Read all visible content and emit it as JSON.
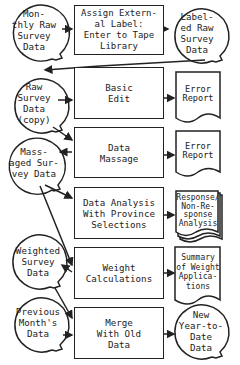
{
  "nodes": {
    "monthly_raw": {
      "label": "Mon-\nthly Raw\nSurvey\nData",
      "shape": "data-circle"
    },
    "assign_label": {
      "label": "Assign Extern-\nal Label:\nEnter to Tape\nLibrary",
      "shape": "process"
    },
    "labeled_raw": {
      "label": "Label-\ned Raw\nSurvey\nData",
      "shape": "data-circle"
    },
    "raw_copy": {
      "label": "Raw\nSurvey\nData\n(copy)",
      "shape": "data-circle"
    },
    "basic_edit": {
      "label": "Basic\nEdit",
      "shape": "process"
    },
    "error_report_1": {
      "label": "Error\nReport",
      "shape": "document"
    },
    "massaged": {
      "label": "Mass-\naged Sur-\nvey Data",
      "shape": "data-circle"
    },
    "data_massage": {
      "label": "Data\nMassage",
      "shape": "process"
    },
    "error_report_2": {
      "label": "Error\nReport",
      "shape": "document"
    },
    "data_analysis": {
      "label": "Data Analysis\nWith Province\nSelections",
      "shape": "process"
    },
    "response_analysis": {
      "label": "Response/\nNon-Re-\nsponse\nAnalysis",
      "shape": "multi-document"
    },
    "weighted": {
      "label": "Weighted\nSurvey\nData",
      "shape": "data-circle"
    },
    "weight_calc": {
      "label": "Weight\nCalculations",
      "shape": "process"
    },
    "weight_summary": {
      "label": "Summary\nof Weight\nApplica-\ntions",
      "shape": "document"
    },
    "previous": {
      "label": "Previous\nMonth's\nData",
      "shape": "data-circle"
    },
    "merge": {
      "label": "Merge\nWith Old\nData",
      "shape": "process"
    },
    "new_ytd": {
      "label": "New\nYear-to-\nDate\nData",
      "shape": "data-circle"
    }
  },
  "colors": {
    "ink": "#222222",
    "paper": "#ffffff"
  }
}
